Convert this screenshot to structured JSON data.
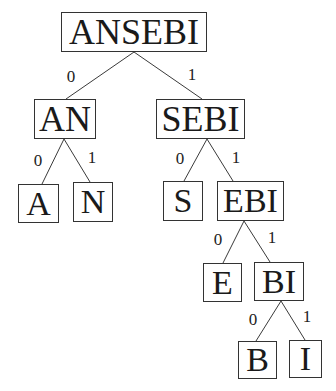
{
  "diagram": {
    "type": "binary-tree",
    "nodes": [
      {
        "id": "ANSEBI",
        "label": "ANSEBI",
        "x": 61,
        "y": 12,
        "w": 146,
        "h": 40,
        "fs": 36
      },
      {
        "id": "AN",
        "label": "AN",
        "x": 34,
        "y": 99,
        "w": 62,
        "h": 40,
        "fs": 36
      },
      {
        "id": "SEBI",
        "label": "SEBI",
        "x": 156,
        "y": 99,
        "w": 89,
        "h": 40,
        "fs": 36
      },
      {
        "id": "A",
        "label": "A",
        "x": 18,
        "y": 184,
        "w": 41,
        "h": 39,
        "fs": 34
      },
      {
        "id": "N",
        "label": "N",
        "x": 73,
        "y": 182,
        "w": 40,
        "h": 40,
        "fs": 34
      },
      {
        "id": "S",
        "label": "S",
        "x": 163,
        "y": 181,
        "w": 40,
        "h": 40,
        "fs": 34
      },
      {
        "id": "EBI",
        "label": "EBI",
        "x": 217,
        "y": 181,
        "w": 67,
        "h": 40,
        "fs": 34
      },
      {
        "id": "E",
        "label": "E",
        "x": 203,
        "y": 263,
        "w": 39,
        "h": 39,
        "fs": 34
      },
      {
        "id": "BI",
        "label": "BI",
        "x": 254,
        "y": 262,
        "w": 50,
        "h": 39,
        "fs": 34
      },
      {
        "id": "B",
        "label": "B",
        "x": 238,
        "y": 341,
        "w": 39,
        "h": 38,
        "fs": 34
      },
      {
        "id": "I",
        "label": "I",
        "x": 289,
        "y": 340,
        "w": 33,
        "h": 38,
        "fs": 34
      }
    ],
    "edges": [
      {
        "from": "ANSEBI",
        "to": "AN",
        "label": "0",
        "x1": 134,
        "y1": 52,
        "x2": 66,
        "y2": 99,
        "lx": 71,
        "ly": 76
      },
      {
        "from": "ANSEBI",
        "to": "SEBI",
        "label": "1",
        "x1": 134,
        "y1": 52,
        "x2": 202,
        "y2": 99,
        "lx": 192,
        "ly": 74
      },
      {
        "from": "AN",
        "to": "A",
        "label": "0",
        "x1": 64,
        "y1": 139,
        "x2": 42,
        "y2": 184,
        "lx": 38,
        "ly": 160
      },
      {
        "from": "AN",
        "to": "N",
        "label": "1",
        "x1": 64,
        "y1": 139,
        "x2": 90,
        "y2": 182,
        "lx": 92,
        "ly": 157
      },
      {
        "from": "SEBI",
        "to": "S",
        "label": "0",
        "x1": 207,
        "y1": 139,
        "x2": 184,
        "y2": 181,
        "lx": 180,
        "ly": 158
      },
      {
        "from": "SEBI",
        "to": "EBI",
        "label": "1",
        "x1": 207,
        "y1": 139,
        "x2": 233,
        "y2": 181,
        "lx": 236,
        "ly": 157
      },
      {
        "from": "EBI",
        "to": "E",
        "label": "0",
        "x1": 244,
        "y1": 221,
        "x2": 223,
        "y2": 263,
        "lx": 218,
        "ly": 239
      },
      {
        "from": "EBI",
        "to": "BI",
        "label": "1",
        "x1": 244,
        "y1": 221,
        "x2": 270,
        "y2": 262,
        "lx": 272,
        "ly": 237
      },
      {
        "from": "BI",
        "to": "B",
        "label": "0",
        "x1": 281,
        "y1": 301,
        "x2": 256,
        "y2": 341,
        "lx": 253,
        "ly": 319
      },
      {
        "from": "BI",
        "to": "I",
        "label": "1",
        "x1": 281,
        "y1": 301,
        "x2": 305,
        "y2": 340,
        "lx": 307,
        "ly": 316
      }
    ]
  }
}
